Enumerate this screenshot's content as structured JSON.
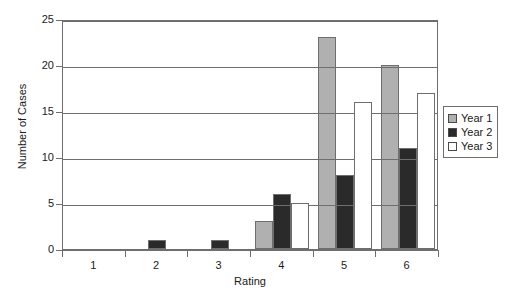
{
  "chart_data": {
    "type": "bar",
    "title": "",
    "xlabel": "Rating",
    "ylabel": "Number of Cases",
    "categories": [
      "1",
      "2",
      "3",
      "4",
      "5",
      "6"
    ],
    "series": [
      {
        "name": "Year 1",
        "color": "#b0b0b0",
        "values": [
          0,
          0,
          0,
          3,
          23,
          20
        ]
      },
      {
        "name": "Year 2",
        "color": "#2a2a2a",
        "values": [
          0,
          1,
          1,
          6,
          8,
          11
        ]
      },
      {
        "name": "Year 3",
        "color": "#ffffff",
        "values": [
          0,
          0,
          0,
          5,
          16,
          17
        ]
      }
    ],
    "ylim": [
      0,
      25
    ],
    "yticks": [
      0,
      5,
      10,
      15,
      20,
      25
    ],
    "ytick_labels": [
      "0",
      "5",
      "10",
      "15",
      "20",
      "25"
    ],
    "xtick_labels": [
      "1",
      "2",
      "3",
      "4",
      "5",
      "6"
    ],
    "grid": "horizontal",
    "legend_position": "right"
  },
  "legend": {
    "entries": [
      {
        "label": "Year 1"
      },
      {
        "label": "Year 2"
      },
      {
        "label": "Year 3"
      }
    ]
  },
  "axes": {
    "x_title": "Rating",
    "y_title": "Number of Cases"
  }
}
